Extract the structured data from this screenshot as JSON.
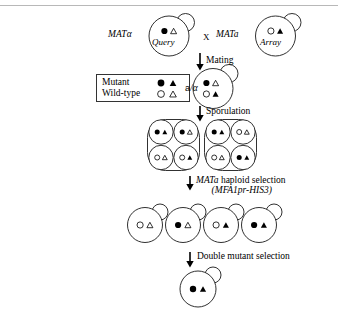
{
  "figure": {
    "title_rule": true,
    "background": "#ffffff",
    "ink": "#000000"
  },
  "legend": {
    "name": "symbol-legend",
    "rows": [
      {
        "label": "Mutant",
        "circle": "filled",
        "triangle": "filled"
      },
      {
        "label": "Wild-type",
        "circle": "open",
        "triangle": "open"
      }
    ]
  },
  "parents": {
    "query": {
      "genotype_label": "MATα",
      "cell_label": "Query",
      "symbols": {
        "circle": "filled",
        "triangle": "open"
      }
    },
    "cross_operator": "X",
    "array": {
      "genotype_label": "MATa",
      "cell_label": "Array",
      "symbols": {
        "circle": "open",
        "triangle": "filled"
      }
    }
  },
  "steps": {
    "mating": {
      "label": "Mating"
    },
    "sporulation": {
      "label": "Sporulation"
    },
    "haploid_selection": {
      "label_line1": "MATa haploid selection",
      "label_line2": "(MFA1pr-HIS3)"
    },
    "double_mutant_selection": {
      "label": "Double mutant selection"
    }
  },
  "diploid": {
    "ploidy_label": "a/α",
    "symbols_top": {
      "circle": "filled",
      "triangle": "open"
    },
    "symbols_bottom": {
      "circle": "open",
      "triangle": "filled"
    }
  },
  "tetrads": [
    {
      "name": "tetrad-left",
      "spores": [
        {
          "circle": "filled",
          "triangle": "filled"
        },
        {
          "circle": "filled",
          "triangle": "open"
        },
        {
          "circle": "open",
          "triangle": "open"
        },
        {
          "circle": "open",
          "triangle": "filled"
        }
      ]
    },
    {
      "name": "tetrad-right",
      "spores": [
        {
          "circle": "filled",
          "triangle": "filled"
        },
        {
          "circle": "open",
          "triangle": "open"
        },
        {
          "circle": "open",
          "triangle": "open"
        },
        {
          "circle": "filled",
          "triangle": "filled"
        }
      ]
    }
  ],
  "haploids": [
    {
      "circle": "open",
      "triangle": "open"
    },
    {
      "circle": "filled",
      "triangle": "open"
    },
    {
      "circle": "open",
      "triangle": "filled"
    },
    {
      "circle": "filled",
      "triangle": "filled"
    }
  ],
  "final_cell": {
    "symbols": {
      "circle": "filled",
      "triangle": "filled"
    }
  }
}
